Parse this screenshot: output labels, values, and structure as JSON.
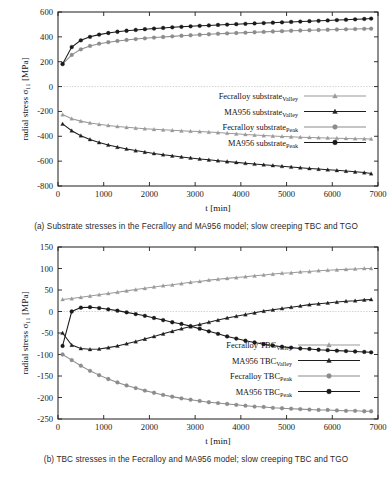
{
  "figure": {
    "panels": [
      {
        "id": "panel-a",
        "caption": "(a) Substrate stresses in the Fecralloy and MA956 model; slow creeping TBC and TGO",
        "chart_data": {
          "type": "line",
          "title": "",
          "xlabel": "t [min]",
          "ylabel": "radial stress σ₁₁ [MPa]",
          "xlim": [
            0,
            7000
          ],
          "ylim": [
            -800,
            600
          ],
          "xticks": [
            0,
            1000,
            2000,
            3000,
            4000,
            5000,
            6000,
            7000
          ],
          "yticks": [
            600,
            400,
            200,
            0,
            -200,
            -400,
            -600,
            -800
          ],
          "grid": false,
          "zero_line": true,
          "legend_position": "center-right",
          "series": [
            {
              "name": "Fecralloy substrate",
              "sub": "Valley",
              "marker": "triangle",
              "color": "#9a9a9a",
              "x": [
                100,
                300,
                500,
                700,
                900,
                1100,
                1300,
                1500,
                1700,
                1900,
                2100,
                2300,
                2500,
                2700,
                2900,
                3100,
                3300,
                3500,
                3700,
                3900,
                4100,
                4300,
                4500,
                4700,
                4900,
                5100,
                5300,
                5500,
                5700,
                5900,
                6100,
                6300,
                6500,
                6700,
                6850
              ],
              "y": [
                -225,
                -258,
                -278,
                -293,
                -304,
                -313,
                -321,
                -328,
                -334,
                -339,
                -344,
                -348,
                -352,
                -356,
                -359,
                -362,
                -366,
                -370,
                -375,
                -380,
                -385,
                -390,
                -394,
                -398,
                -401,
                -404,
                -407,
                -409,
                -411,
                -413,
                -415,
                -417,
                -419,
                -420,
                -421
              ]
            },
            {
              "name": "MA956 substrate",
              "sub": "Valley",
              "marker": "triangle",
              "color": "#1f1f1f",
              "x": [
                100,
                300,
                500,
                700,
                900,
                1100,
                1300,
                1500,
                1700,
                1900,
                2100,
                2300,
                2500,
                2700,
                2900,
                3100,
                3300,
                3500,
                3700,
                3900,
                4100,
                4300,
                4500,
                4700,
                4900,
                5100,
                5300,
                5500,
                5700,
                5900,
                6100,
                6300,
                6500,
                6700,
                6850
              ],
              "y": [
                -300,
                -355,
                -395,
                -425,
                -450,
                -470,
                -487,
                -502,
                -515,
                -527,
                -538,
                -548,
                -557,
                -566,
                -574,
                -582,
                -589,
                -596,
                -603,
                -610,
                -617,
                -623,
                -629,
                -635,
                -641,
                -647,
                -653,
                -659,
                -664,
                -669,
                -674,
                -680,
                -686,
                -692,
                -700
              ]
            },
            {
              "name": "Fecralloy substrate",
              "sub": "Peak",
              "marker": "circle",
              "color": "#8c8c8c",
              "x": [
                100,
                300,
                500,
                700,
                900,
                1100,
                1300,
                1500,
                1700,
                1900,
                2100,
                2300,
                2500,
                2700,
                2900,
                3100,
                3300,
                3500,
                3700,
                3900,
                4100,
                4300,
                4500,
                4700,
                4900,
                5100,
                5300,
                5500,
                5700,
                5900,
                6100,
                6300,
                6500,
                6700,
                6850
              ],
              "y": [
                180,
                255,
                300,
                327,
                345,
                357,
                367,
                375,
                382,
                388,
                394,
                399,
                404,
                409,
                413,
                417,
                421,
                425,
                428,
                431,
                434,
                437,
                440,
                443,
                446,
                449,
                451,
                453,
                455,
                457,
                459,
                461,
                463,
                465,
                466
              ]
            },
            {
              "name": "MA956 substrate",
              "sub": "Peak",
              "marker": "circle",
              "color": "#1a1a1a",
              "x": [
                100,
                300,
                500,
                700,
                900,
                1100,
                1300,
                1500,
                1700,
                1900,
                2100,
                2300,
                2500,
                2700,
                2900,
                3100,
                3300,
                3500,
                3700,
                3900,
                4100,
                4300,
                4500,
                4700,
                4900,
                5100,
                5300,
                5500,
                5700,
                5900,
                6100,
                6300,
                6500,
                6700,
                6850
              ],
              "y": [
                182,
                318,
                372,
                400,
                418,
                431,
                441,
                449,
                456,
                462,
                467,
                472,
                477,
                481,
                485,
                489,
                492,
                496,
                499,
                502,
                505,
                508,
                511,
                514,
                517,
                520,
                523,
                526,
                529,
                532,
                535,
                538,
                541,
                544,
                547
              ]
            }
          ]
        }
      },
      {
        "id": "panel-b",
        "caption": "(b) TBC stresses in the Fecralloy and MA956 model; slow creeping TBC and TGO",
        "chart_data": {
          "type": "line",
          "title": "",
          "xlabel": "t [min]",
          "ylabel": "radial stress σ₁₁ [MPa]",
          "xlim": [
            0,
            7000
          ],
          "ylim": [
            -250,
            150
          ],
          "xticks": [
            0,
            1000,
            2000,
            3000,
            4000,
            5000,
            6000,
            7000
          ],
          "yticks": [
            150,
            100,
            50,
            0,
            -50,
            -100,
            -150,
            -200,
            -250
          ],
          "grid": false,
          "zero_line": true,
          "legend_position": "lower-right",
          "series": [
            {
              "name": "Fecralloy TBC",
              "sub": "Valley",
              "marker": "triangle",
              "color": "#9a9a9a",
              "x": [
                100,
                300,
                500,
                700,
                900,
                1100,
                1300,
                1500,
                1700,
                1900,
                2100,
                2300,
                2500,
                2700,
                2900,
                3100,
                3300,
                3500,
                3700,
                3900,
                4100,
                4300,
                4500,
                4700,
                4900,
                5100,
                5300,
                5500,
                5700,
                5900,
                6100,
                6300,
                6500,
                6700,
                6850
              ],
              "y": [
                28,
                30,
                33,
                36,
                39,
                42,
                45,
                48,
                51,
                54,
                57,
                60,
                62,
                65,
                68,
                70,
                73,
                75,
                77,
                79,
                81,
                83,
                85,
                87,
                89,
                90,
                92,
                93,
                95,
                96,
                97,
                98,
                99,
                100,
                100
              ]
            },
            {
              "name": "MA956 TBC",
              "sub": "Valley",
              "marker": "triangle",
              "color": "#1f1f1f",
              "x": [
                100,
                300,
                500,
                700,
                900,
                1100,
                1300,
                1500,
                1700,
                1900,
                2100,
                2300,
                2500,
                2700,
                2900,
                3100,
                3300,
                3500,
                3700,
                3900,
                4100,
                4300,
                4500,
                4700,
                4900,
                5100,
                5300,
                5500,
                5700,
                5900,
                6100,
                6300,
                6500,
                6700,
                6850
              ],
              "y": [
                -50,
                -78,
                -86,
                -88,
                -87,
                -84,
                -80,
                -75,
                -70,
                -64,
                -58,
                -52,
                -46,
                -40,
                -35,
                -30,
                -25,
                -20,
                -15,
                -11,
                -7,
                -3,
                1,
                4,
                7,
                10,
                13,
                16,
                18,
                20,
                22,
                24,
                25,
                27,
                28
              ]
            },
            {
              "name": "Fecralloy TBC",
              "sub": "Peak",
              "marker": "circle",
              "color": "#8c8c8c",
              "x": [
                100,
                300,
                500,
                700,
                900,
                1100,
                1300,
                1500,
                1700,
                1900,
                2100,
                2300,
                2500,
                2700,
                2900,
                3100,
                3300,
                3500,
                3700,
                3900,
                4100,
                4300,
                4500,
                4700,
                4900,
                5100,
                5300,
                5500,
                5700,
                5900,
                6100,
                6300,
                6500,
                6700,
                6850
              ],
              "y": [
                -100,
                -113,
                -126,
                -138,
                -148,
                -157,
                -165,
                -172,
                -178,
                -184,
                -189,
                -194,
                -198,
                -202,
                -205,
                -208,
                -211,
                -213,
                -215,
                -217,
                -219,
                -221,
                -222,
                -224,
                -225,
                -226,
                -227,
                -228,
                -229,
                -229,
                -230,
                -231,
                -231,
                -232,
                -232
              ]
            },
            {
              "name": "MA956 TBC",
              "sub": "Peak",
              "marker": "circle",
              "color": "#1a1a1a",
              "x": [
                100,
                300,
                500,
                700,
                900,
                1100,
                1300,
                1500,
                1700,
                1900,
                2100,
                2300,
                2500,
                2700,
                2900,
                3100,
                3300,
                3500,
                3700,
                3900,
                4100,
                4300,
                4500,
                4700,
                4900,
                5100,
                5300,
                5500,
                5700,
                5900,
                6100,
                6300,
                6500,
                6700,
                6850
              ],
              "y": [
                -80,
                0,
                9,
                10,
                8,
                5,
                2,
                -2,
                -6,
                -10,
                -15,
                -20,
                -25,
                -29,
                -34,
                -40,
                -46,
                -52,
                -58,
                -63,
                -68,
                -72,
                -76,
                -79,
                -82,
                -84,
                -86,
                -87,
                -89,
                -90,
                -91,
                -92,
                -93,
                -94,
                -95
              ]
            }
          ]
        }
      }
    ]
  }
}
